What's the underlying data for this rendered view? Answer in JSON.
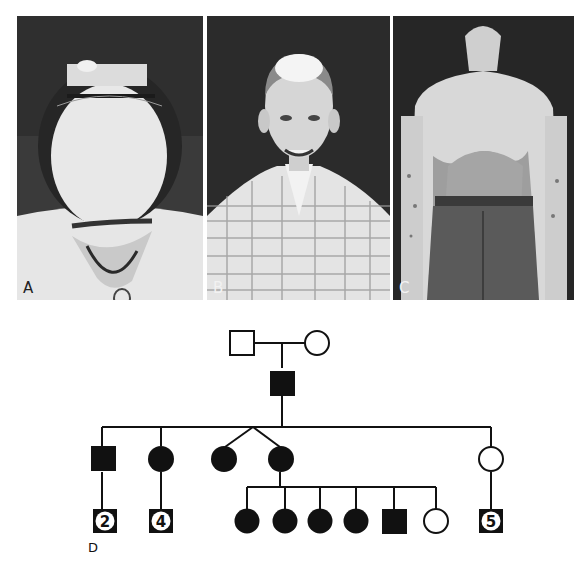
{
  "figure": {
    "panels": [
      {
        "id": "A",
        "label": "A",
        "description": "Top-down view of a head with a white forelock / frontal patch of white hair held back by a hair band"
      },
      {
        "id": "B",
        "label": "B",
        "description": "Smiling boy in plaid shirt with depigmented (white) frontal hair and scalp patch"
      },
      {
        "id": "C",
        "label": "C",
        "description": "Back view of a man showing large depigmented patches on back and arms (piebaldism)"
      }
    ],
    "pedigree": {
      "label": "D",
      "generations": [
        {
          "generation": "I",
          "individuals": [
            {
              "id": "I-1",
              "sex": "male",
              "affected": false
            },
            {
              "id": "I-2",
              "sex": "female",
              "affected": false
            }
          ]
        },
        {
          "generation": "II",
          "individuals": [
            {
              "id": "II-1",
              "sex": "male",
              "affected": true
            }
          ]
        },
        {
          "generation": "III",
          "individuals": [
            {
              "id": "III-1",
              "sex": "male",
              "affected": true
            },
            {
              "id": "III-2",
              "sex": "female",
              "affected": true
            },
            {
              "id": "III-3",
              "sex": "female",
              "affected": true,
              "twin": "III-4"
            },
            {
              "id": "III-4",
              "sex": "female",
              "affected": true,
              "twin": "III-3"
            },
            {
              "id": "III-5",
              "sex": "female",
              "affected": false
            }
          ]
        },
        {
          "generation": "IV",
          "individuals": [
            {
              "id": "IV-a",
              "sex": "unknown",
              "affected": false,
              "count": "2",
              "parent": "III-1"
            },
            {
              "id": "IV-b",
              "sex": "unknown",
              "affected": false,
              "count": "4",
              "parent": "III-2"
            },
            {
              "id": "IV-1",
              "sex": "female",
              "affected": true,
              "parent": "III-4"
            },
            {
              "id": "IV-2",
              "sex": "female",
              "affected": true,
              "parent": "III-4"
            },
            {
              "id": "IV-3",
              "sex": "female",
              "affected": true,
              "parent": "III-4"
            },
            {
              "id": "IV-4",
              "sex": "female",
              "affected": true,
              "parent": "III-4"
            },
            {
              "id": "IV-5",
              "sex": "male",
              "affected": true,
              "parent": "III-4"
            },
            {
              "id": "IV-6",
              "sex": "female",
              "affected": false,
              "parent": "III-4"
            },
            {
              "id": "IV-c",
              "sex": "unknown",
              "affected": false,
              "count": "5",
              "parent": "III-5"
            }
          ]
        }
      ],
      "counts": {
        "c1": "2",
        "c2": "4",
        "c3": "5"
      }
    },
    "colors": {
      "ink": "#111111",
      "background": "#ffffff"
    }
  }
}
